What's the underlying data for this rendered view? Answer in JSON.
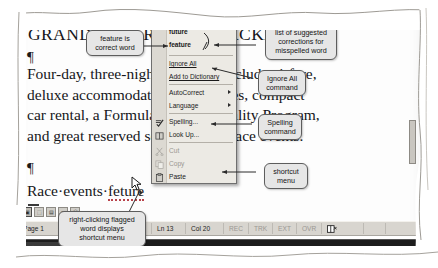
{
  "document": {
    "heading": "GRAND PRIX RACING PACKAGE",
    "paragraph_lines": [
      "Four-day, three-night packages include airfare,",
      "deluxe accommodations, amenities, compact",
      "car rental, a Formula One Hospitality Program,",
      "and great reserved seating at the race events."
    ],
    "last_line_prefix": "Race·events·",
    "last_line_flagged_word": "feture",
    "paragraph_mark": "¶",
    "space_dot": "·"
  },
  "context_menu": {
    "name": "shortcut-menu",
    "suggestions": [
      {
        "label": "future",
        "bold": true
      },
      {
        "label": "feature",
        "bold": true
      }
    ],
    "items": [
      {
        "label": "Ignore All",
        "accel": "I",
        "disabled": false,
        "submenu": false,
        "icon": ""
      },
      {
        "label": "Add to Dictionary",
        "accel": "A",
        "disabled": false,
        "submenu": false,
        "icon": ""
      },
      {
        "label": "AutoCorrect",
        "accel": "u",
        "disabled": false,
        "submenu": true,
        "icon": ""
      },
      {
        "label": "Language",
        "accel": "a",
        "disabled": false,
        "submenu": true,
        "icon": ""
      },
      {
        "label": "Spelling...",
        "accel": "S",
        "disabled": false,
        "submenu": false,
        "icon": "spellcheck-icon"
      },
      {
        "label": "Look Up...",
        "accel": "k",
        "disabled": false,
        "submenu": false,
        "icon": "book-lookup-icon"
      },
      {
        "label": "Cut",
        "accel": "t",
        "disabled": true,
        "submenu": false,
        "icon": "scissors-icon"
      },
      {
        "label": "Copy",
        "accel": "C",
        "disabled": true,
        "submenu": false,
        "icon": "copy-icon"
      },
      {
        "label": "Paste",
        "accel": "P",
        "disabled": false,
        "submenu": false,
        "icon": "paste-icon"
      }
    ]
  },
  "callouts": [
    {
      "id": "correct-word",
      "lines": [
        "feature is",
        "correct word"
      ]
    },
    {
      "id": "suggestions-list",
      "lines": [
        "list of suggested",
        "corrections for",
        "misspelled word"
      ]
    },
    {
      "id": "ignore-all",
      "lines": [
        "Ignore All",
        "command"
      ]
    },
    {
      "id": "spelling",
      "lines": [
        "Spelling",
        "command"
      ]
    },
    {
      "id": "shortcut-menu",
      "lines": [
        "shortcut",
        "menu"
      ]
    },
    {
      "id": "right-click",
      "lines": [
        "right-clicking flagged",
        "word displays",
        "shortcut menu"
      ]
    }
  ],
  "status_bar": {
    "page": "Page 1",
    "section": "Se",
    "position": "2\"",
    "line": "Ln 13",
    "column": "Col 20",
    "indicators": [
      "REC",
      "TRK",
      "EXT",
      "OVR"
    ],
    "spell_icon": "spelling-status-icon"
  },
  "view_buttons": [
    {
      "name": "normal-view",
      "glyph": "▣",
      "active": true
    },
    {
      "name": "web-layout-view",
      "glyph": "⬚",
      "active": false
    },
    {
      "name": "print-layout-view",
      "glyph": "▤",
      "active": false
    },
    {
      "name": "outline-view",
      "glyph": "≡",
      "active": false
    },
    {
      "name": "reading-layout-view",
      "glyph": "Ⓦ",
      "active": false
    }
  ],
  "taskbar": {
    "start_label": "start",
    "start_glyph": "❖",
    "task_label": "Microsoft Word - Packet..."
  },
  "colors": {
    "menu_face": "#eceae4",
    "menu_icon_col": "#dcd9d2",
    "callout_fill": "#e6e6e6",
    "callout_border": "#5d5d5d",
    "squiggle_red": "#b8424a",
    "statusbar": "#d8d5cf",
    "taskbar": "#1d1d1d",
    "disabled_text": "#9a9891"
  }
}
